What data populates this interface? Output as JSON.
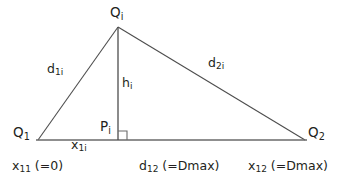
{
  "figure": {
    "type": "geometry-diagram",
    "stroke_color": "#4d4d4d",
    "text_color": "#231f20",
    "background_color": "#ffffff"
  },
  "geometry": {
    "points": {
      "Qi": {
        "x": 118,
        "y": 27
      },
      "Q1": {
        "x": 38,
        "y": 140
      },
      "Q2": {
        "x": 305,
        "y": 140
      },
      "Pi": {
        "x": 118,
        "y": 140
      }
    },
    "segments": [
      {
        "name": "d1i",
        "from": "Q1",
        "to": "Qi"
      },
      {
        "name": "d2i",
        "from": "Qi",
        "to": "Q2"
      },
      {
        "name": "base",
        "from": "Q1",
        "to": "Q2"
      },
      {
        "name": "hi",
        "from": "Qi",
        "to": "Pi"
      }
    ],
    "right_angle_marker": {
      "x": 118,
      "y": 140,
      "size": 9
    }
  },
  "labels": {
    "apex": {
      "base": "Q",
      "sub": "i"
    },
    "left_vertex": {
      "base": "Q",
      "sub": "1"
    },
    "right_vertex": {
      "base": "Q",
      "sub": "2"
    },
    "foot": {
      "base": "P",
      "sub": "i"
    },
    "left_side": {
      "base": "d",
      "sub": "1i"
    },
    "right_side": {
      "base": "d",
      "sub": "2i"
    },
    "height": {
      "base": "h",
      "sub": "i"
    },
    "base_left_segment": {
      "base": "x",
      "sub": "1i"
    }
  },
  "axis_annotations": {
    "left": {
      "base": "x",
      "sub": "11",
      "value": " (=0)"
    },
    "center": {
      "base": "d",
      "sub": "12",
      "value": " (=Dmax)"
    },
    "right": {
      "base": "x",
      "sub": "12",
      "value": " (=Dmax)"
    }
  }
}
